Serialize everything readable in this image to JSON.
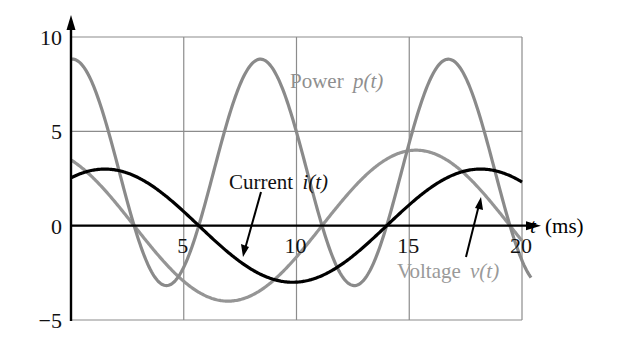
{
  "chart_data": {
    "type": "line",
    "title": "",
    "xlabel": "t (ms)",
    "xlabel_var": "t",
    "xlabel_unit": "(ms)",
    "ylabel": "",
    "xlim": [
      0,
      20
    ],
    "ylim": [
      -5,
      10
    ],
    "grid": true,
    "x_ticks": [
      0,
      5,
      10,
      15,
      20
    ],
    "x_tick_labels": [
      "5",
      "10",
      "15",
      "20"
    ],
    "y_ticks": [
      -5,
      0,
      5,
      10
    ],
    "y_tick_labels": [
      "−5",
      "0",
      "5",
      "10"
    ],
    "series": [
      {
        "name": "Power p(t)",
        "label_word": "Power",
        "label_fn": "p(t)",
        "color": "#8a8a8a",
        "label_color": "#8f8f8f",
        "formula": "p = v * i",
        "x": [
          0,
          1,
          2,
          3,
          4,
          5,
          6,
          7,
          8,
          9,
          10,
          11,
          12,
          13,
          14,
          15,
          16,
          17,
          18,
          19,
          20
        ],
        "values": [
          8.8,
          8.0,
          4.6,
          -0.1,
          -2.9,
          -2.6,
          0.8,
          5.0,
          8.2,
          8.3,
          4.7,
          0.1,
          -2.9,
          -2.6,
          0.8,
          5.1,
          8.2,
          8.3,
          4.7,
          0.1,
          -2.9
        ]
      },
      {
        "name": "Voltage v(t)",
        "label_word": "Voltage",
        "label_fn": "v(t)",
        "color": "#959595",
        "label_color": "#9a9a9a",
        "amplitude": 4,
        "peak_ms": 15.3,
        "x": [
          0,
          1,
          2,
          3,
          4,
          5,
          6,
          7,
          8,
          9,
          10,
          11,
          12,
          13,
          14,
          15,
          16,
          17,
          18,
          19,
          20
        ],
        "values": [
          3.5,
          2.2,
          0.6,
          -1.2,
          -2.7,
          -3.7,
          -4.0,
          -3.6,
          -2.3,
          -0.7,
          1.1,
          2.6,
          3.6,
          4.0,
          3.6,
          4.0,
          3.6,
          2.5,
          0.9,
          -0.8,
          -2.3
        ]
      },
      {
        "name": "Current i(t)",
        "label_word": "Current",
        "label_fn": "i(t)",
        "color": "#000000",
        "label_color": "#111111",
        "amplitude": 3,
        "peak_ms": 1.5,
        "x": [
          0,
          1,
          2,
          3,
          4,
          5,
          6,
          7,
          8,
          9,
          10,
          11,
          12,
          13,
          14,
          15,
          16,
          17,
          18,
          19,
          20
        ],
        "values": [
          2.5,
          3.0,
          2.9,
          2.4,
          1.5,
          0.5,
          -0.7,
          -1.8,
          -2.6,
          -3.0,
          -3.0,
          -2.5,
          -1.6,
          -0.5,
          0.6,
          1.7,
          2.5,
          2.9,
          3.0,
          2.6,
          1.9
        ]
      }
    ],
    "frequency_hz": 60,
    "legend_position": "inline annotations with arrows"
  }
}
